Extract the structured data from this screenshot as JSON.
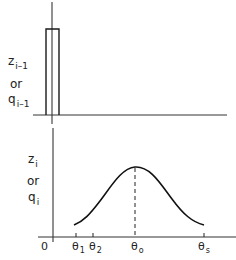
{
  "diagram": {
    "top_panel": {
      "ylabel_line1": "z",
      "ylabel_line1_sub": "i–1",
      "ylabel_line2": "or",
      "ylabel_line3": "q",
      "ylabel_line3_sub": "i–1",
      "shape": "narrow rectangular pulse at origin"
    },
    "bottom_panel": {
      "ylabel_line1": "z",
      "ylabel_line1_sub": "i",
      "ylabel_line2": "or",
      "ylabel_line3": "q",
      "ylabel_line3_sub": "i",
      "shape": "bell-shaped curve from θ1 to θs peaking at θo",
      "x_ticks": [
        {
          "main": "0",
          "sub": ""
        },
        {
          "main": "θ",
          "sub": "1"
        },
        {
          "main": "θ",
          "sub": "2"
        },
        {
          "main": "θ",
          "sub": "o"
        },
        {
          "main": "θ",
          "sub": "s"
        }
      ]
    },
    "colors": {
      "line": "#1a1a1a",
      "background": "#ffffff"
    }
  }
}
